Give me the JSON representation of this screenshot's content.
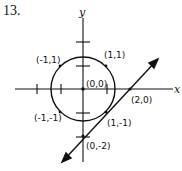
{
  "problem_number": "13.",
  "axes": {
    "x_label": "x",
    "y_label": "y",
    "origin_px": [
      83,
      89
    ],
    "unit_px": 23.5
  },
  "circle": {
    "center": [
      0,
      0
    ],
    "radius": 1.3,
    "stroke": "#111111"
  },
  "line": {
    "equation": "y = x - 2",
    "from": [
      -0.9,
      -3.1
    ],
    "to": [
      3.2,
      1.3
    ],
    "stroke": "#111111"
  },
  "labels": [
    {
      "text": "(-1,1)",
      "x": 36,
      "y": 63
    },
    {
      "text": "(1,1)",
      "x": 104,
      "y": 58
    },
    {
      "text": "(0,0)",
      "x": 86,
      "y": 87
    },
    {
      "text": "(2,0)",
      "x": 131,
      "y": 103
    },
    {
      "text": "(-1,-1)",
      "x": 34,
      "y": 121
    },
    {
      "text": "(1,-1)",
      "x": 107,
      "y": 126
    },
    {
      "text": "(0,-2)",
      "x": 86,
      "y": 149
    }
  ],
  "points": [
    {
      "name": "origin",
      "coord": [
        0,
        0
      ]
    },
    {
      "name": "x-intercept",
      "coord": [
        2,
        0
      ]
    },
    {
      "name": "y-intercept",
      "coord": [
        0,
        -2
      ]
    },
    {
      "name": "tangent-point",
      "coord": [
        1,
        -1
      ]
    },
    {
      "name": "point-1-1",
      "coord": [
        1,
        1
      ]
    },
    {
      "name": "point-neg1-1",
      "coord": [
        -1,
        1
      ]
    },
    {
      "name": "point-neg1-neg1",
      "coord": [
        -1,
        -1
      ]
    }
  ]
}
